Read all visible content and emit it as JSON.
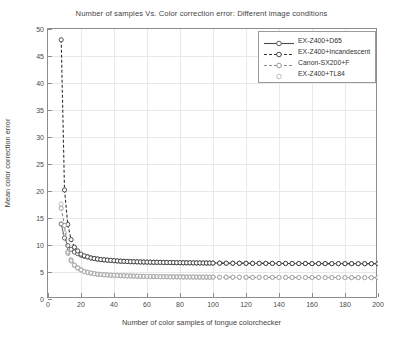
{
  "chart_data": {
    "type": "line",
    "title": "Number of samples Vs. Color correction error: Different image conditions",
    "xlabel": "Number of color samples of tongue colorchecker",
    "ylabel": "Mean color correction error",
    "xlim": [
      0,
      200
    ],
    "ylim": [
      0,
      50
    ],
    "xticks": [
      0,
      20,
      40,
      60,
      80,
      100,
      120,
      140,
      160,
      180,
      200
    ],
    "yticks": [
      0,
      5,
      10,
      15,
      20,
      25,
      30,
      35,
      40,
      45,
      50
    ],
    "grid": true,
    "legend_position": "top-right",
    "series": [
      {
        "name": "EX-Z400+D65",
        "style": "solid",
        "marker": "circle",
        "color": "#4d4d4d",
        "x": [
          8,
          10,
          12,
          14,
          16,
          18,
          20,
          22,
          24,
          26,
          28,
          30,
          32,
          34,
          36,
          38,
          40,
          42,
          44,
          46,
          48,
          50,
          52,
          54,
          56,
          58,
          60,
          62,
          64,
          66,
          68,
          70,
          72,
          74,
          76,
          78,
          80,
          82,
          84,
          86,
          88,
          90,
          92,
          94,
          96,
          98,
          100,
          104,
          108,
          112,
          116,
          120,
          124,
          128,
          132,
          136,
          140,
          144,
          148,
          152,
          156,
          160,
          164,
          168,
          172,
          176,
          180,
          184,
          188,
          192,
          196,
          200
        ],
        "y": [
          13.9,
          11.3,
          9.9,
          9.2,
          8.7,
          8.4,
          8.1,
          7.9,
          7.8,
          7.6,
          7.5,
          7.4,
          7.3,
          7.25,
          7.2,
          7.15,
          7.1,
          7.05,
          7.0,
          6.98,
          6.95,
          6.92,
          6.9,
          6.88,
          6.86,
          6.85,
          6.83,
          6.82,
          6.8,
          6.79,
          6.78,
          6.77,
          6.76,
          6.75,
          6.74,
          6.73,
          6.72,
          6.71,
          6.7,
          6.7,
          6.69,
          6.68,
          6.68,
          6.67,
          6.66,
          6.66,
          6.65,
          6.64,
          6.63,
          6.62,
          6.62,
          6.61,
          6.6,
          6.6,
          6.59,
          6.59,
          6.58,
          6.58,
          6.57,
          6.57,
          6.57,
          6.56,
          6.56,
          6.56,
          6.55,
          6.55,
          6.55,
          6.55,
          6.54,
          6.54,
          6.54,
          6.54
        ]
      },
      {
        "name": "EX-Z400+Incandescent",
        "style": "dashed",
        "marker": "circle",
        "color": "#333333",
        "x": [
          8,
          10,
          12,
          14,
          16,
          18,
          20,
          22,
          24,
          26,
          28,
          30,
          32,
          34,
          36,
          38,
          40,
          42,
          44,
          46,
          48,
          50,
          52,
          54,
          56,
          58,
          60,
          62,
          64,
          66,
          68,
          70,
          72,
          74,
          76,
          78,
          80,
          82,
          84,
          86,
          88,
          90,
          92,
          94,
          96,
          98,
          100,
          104,
          108,
          112,
          116,
          120,
          124,
          128,
          132,
          136,
          140,
          144,
          148,
          152,
          156,
          160,
          164,
          168,
          172,
          176,
          180,
          184,
          188,
          192,
          196,
          200
        ],
        "y": [
          48.0,
          20.2,
          13.8,
          11.0,
          9.6,
          8.9,
          8.3,
          8.0,
          7.8,
          7.6,
          7.5,
          7.4,
          7.3,
          7.25,
          7.2,
          7.15,
          7.1,
          7.05,
          7.0,
          6.98,
          6.95,
          6.92,
          6.9,
          6.88,
          6.86,
          6.85,
          6.83,
          6.82,
          6.8,
          6.79,
          6.78,
          6.77,
          6.76,
          6.75,
          6.74,
          6.73,
          6.72,
          6.71,
          6.7,
          6.7,
          6.69,
          6.68,
          6.68,
          6.67,
          6.66,
          6.66,
          6.65,
          6.64,
          6.63,
          6.62,
          6.62,
          6.61,
          6.6,
          6.6,
          6.59,
          6.59,
          6.58,
          6.58,
          6.57,
          6.57,
          6.57,
          6.56,
          6.56,
          6.56,
          6.55,
          6.55,
          6.55,
          6.55,
          6.54,
          6.54,
          6.54,
          6.54
        ]
      },
      {
        "name": "Canon-SX200+F",
        "style": "dashed",
        "marker": "circle",
        "color": "#8c8c8c",
        "x": [
          8,
          10,
          12,
          14,
          16,
          18,
          20,
          22,
          24,
          26,
          28,
          30,
          32,
          34,
          36,
          38,
          40,
          42,
          44,
          46,
          48,
          50,
          52,
          54,
          56,
          58,
          60,
          62,
          64,
          66,
          68,
          70,
          72,
          74,
          76,
          78,
          80,
          82,
          84,
          86,
          88,
          90,
          92,
          94,
          96,
          98,
          100,
          104,
          108,
          112,
          116,
          120,
          124,
          128,
          132,
          136,
          140,
          144,
          148,
          152,
          156,
          160,
          164,
          168,
          172,
          176,
          180,
          184,
          188,
          192,
          196,
          200
        ],
        "y": [
          16.8,
          13.6,
          8.7,
          7.2,
          6.3,
          5.8,
          5.4,
          5.1,
          4.95,
          4.8,
          4.7,
          4.6,
          4.55,
          4.5,
          4.45,
          4.4,
          4.38,
          4.35,
          4.32,
          4.3,
          4.28,
          4.26,
          4.24,
          4.22,
          4.2,
          4.19,
          4.18,
          4.17,
          4.16,
          4.15,
          4.14,
          4.13,
          4.12,
          4.11,
          4.1,
          4.1,
          4.09,
          4.08,
          4.08,
          4.07,
          4.07,
          4.06,
          4.06,
          4.05,
          4.05,
          4.04,
          4.04,
          4.03,
          4.03,
          4.02,
          4.02,
          4.01,
          4.01,
          4.0,
          4.0,
          4.0,
          3.99,
          3.99,
          3.99,
          3.98,
          3.98,
          3.98,
          3.98,
          3.97,
          3.97,
          3.97,
          3.97,
          3.96,
          3.96,
          3.96,
          3.96,
          3.96
        ]
      },
      {
        "name": "EX-Z400+TL84",
        "style": "none",
        "marker": "circle-open",
        "color": "#b5b5b5",
        "x": [
          8,
          10,
          12,
          14,
          16,
          18,
          20,
          22,
          24,
          26,
          28,
          30,
          32,
          34,
          36,
          38,
          40,
          42,
          44,
          46,
          48,
          50,
          52,
          54,
          56,
          58,
          60,
          62,
          64,
          66,
          68,
          70,
          72,
          74,
          76,
          78,
          80,
          82,
          84,
          86,
          88,
          90,
          92,
          94,
          96,
          98,
          100,
          104,
          108,
          112,
          116,
          120,
          124,
          128,
          132,
          136,
          140,
          144,
          148,
          152,
          156,
          160,
          164,
          168,
          172,
          176,
          180,
          184,
          188,
          192,
          196,
          200
        ],
        "y": [
          17.6,
          12.2,
          8.4,
          7.0,
          6.2,
          5.7,
          5.35,
          5.05,
          4.9,
          4.78,
          4.68,
          4.58,
          4.53,
          4.48,
          4.44,
          4.39,
          4.37,
          4.34,
          4.31,
          4.29,
          4.27,
          4.25,
          4.23,
          4.21,
          4.2,
          4.19,
          4.18,
          4.17,
          4.16,
          4.15,
          4.14,
          4.13,
          4.12,
          4.11,
          4.1,
          4.1,
          4.09,
          4.08,
          4.08,
          4.07,
          4.07,
          4.06,
          4.06,
          4.05,
          4.05,
          4.04,
          4.04,
          4.03,
          4.03,
          4.02,
          4.02,
          4.01,
          4.01,
          4.0,
          4.0,
          4.0,
          3.99,
          3.99,
          3.99,
          3.98,
          3.98,
          3.98,
          3.98,
          3.97,
          3.97,
          3.97,
          3.97,
          3.96,
          3.96,
          3.96,
          3.96,
          3.96
        ]
      }
    ]
  },
  "legend": {
    "items": [
      {
        "label": "EX-Z400+D65"
      },
      {
        "label": "EX-Z400+Incandescent"
      },
      {
        "label": "Canon-SX200+F"
      },
      {
        "label": "EX-Z400+TL84"
      }
    ]
  }
}
